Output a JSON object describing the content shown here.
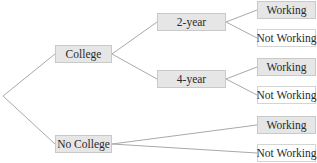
{
  "diagram": {
    "type": "tree",
    "root": {
      "x": 3,
      "y": 96
    },
    "line_color": "#a9a9a9",
    "nodes": [
      {
        "id": "college",
        "label": "College",
        "x": 55,
        "y": 45,
        "w": 57,
        "h": 18,
        "style": "filled"
      },
      {
        "id": "no-college",
        "label": "No College",
        "x": 55,
        "y": 135,
        "w": 57,
        "h": 18,
        "style": "filled"
      },
      {
        "id": "two-year",
        "label": "2-year",
        "x": 157,
        "y": 13,
        "w": 69,
        "h": 18,
        "style": "filled"
      },
      {
        "id": "four-year",
        "label": "4-year",
        "x": 157,
        "y": 70,
        "w": 69,
        "h": 18,
        "style": "filled"
      },
      {
        "id": "two-year-working",
        "label": "Working",
        "x": 257,
        "y": 1,
        "w": 59,
        "h": 18,
        "style": "filled"
      },
      {
        "id": "two-year-not-working",
        "label": "Not Working",
        "x": 257,
        "y": 29,
        "w": 59,
        "h": 18,
        "style": "plain"
      },
      {
        "id": "four-year-working",
        "label": "Working",
        "x": 257,
        "y": 58,
        "w": 59,
        "h": 18,
        "style": "filled"
      },
      {
        "id": "four-year-not-working",
        "label": "Not Working",
        "x": 257,
        "y": 86,
        "w": 59,
        "h": 18,
        "style": "plain"
      },
      {
        "id": "no-college-working",
        "label": "Working",
        "x": 257,
        "y": 116,
        "w": 59,
        "h": 18,
        "style": "filled"
      },
      {
        "id": "no-college-not-working",
        "label": "Not Working",
        "x": 257,
        "y": 144,
        "w": 59,
        "h": 18,
        "style": "plain"
      }
    ],
    "edges": [
      {
        "from": "root",
        "to": "college"
      },
      {
        "from": "root",
        "to": "no-college"
      },
      {
        "from": "college",
        "to": "two-year"
      },
      {
        "from": "college",
        "to": "four-year"
      },
      {
        "from": "two-year",
        "to": "two-year-working"
      },
      {
        "from": "two-year",
        "to": "two-year-not-working"
      },
      {
        "from": "four-year",
        "to": "four-year-working"
      },
      {
        "from": "four-year",
        "to": "four-year-not-working"
      },
      {
        "from": "no-college",
        "to": "no-college-working"
      },
      {
        "from": "no-college",
        "to": "no-college-not-working"
      }
    ]
  }
}
